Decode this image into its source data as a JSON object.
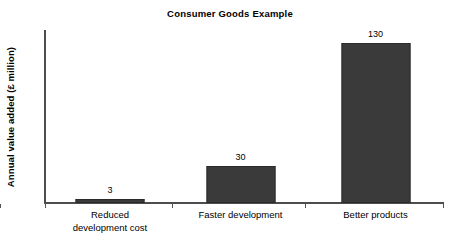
{
  "chart_data": {
    "type": "bar",
    "title": "Consumer Goods Example",
    "xlabel": "",
    "ylabel": "Annual value added (£ million)",
    "categories": [
      "Reduced\ndevelopment cost",
      "Faster development",
      "Better products"
    ],
    "values": [
      3,
      30,
      130
    ],
    "value_labels": [
      "3",
      "30",
      "130"
    ],
    "ylim": [
      0,
      140
    ],
    "grid": false,
    "legend": null,
    "series": [
      {
        "name": "Annual value added",
        "values": [
          3,
          30,
          130
        ]
      }
    ],
    "bar_color": "#3a3a3a",
    "axis_color": "#4d4d4d"
  }
}
